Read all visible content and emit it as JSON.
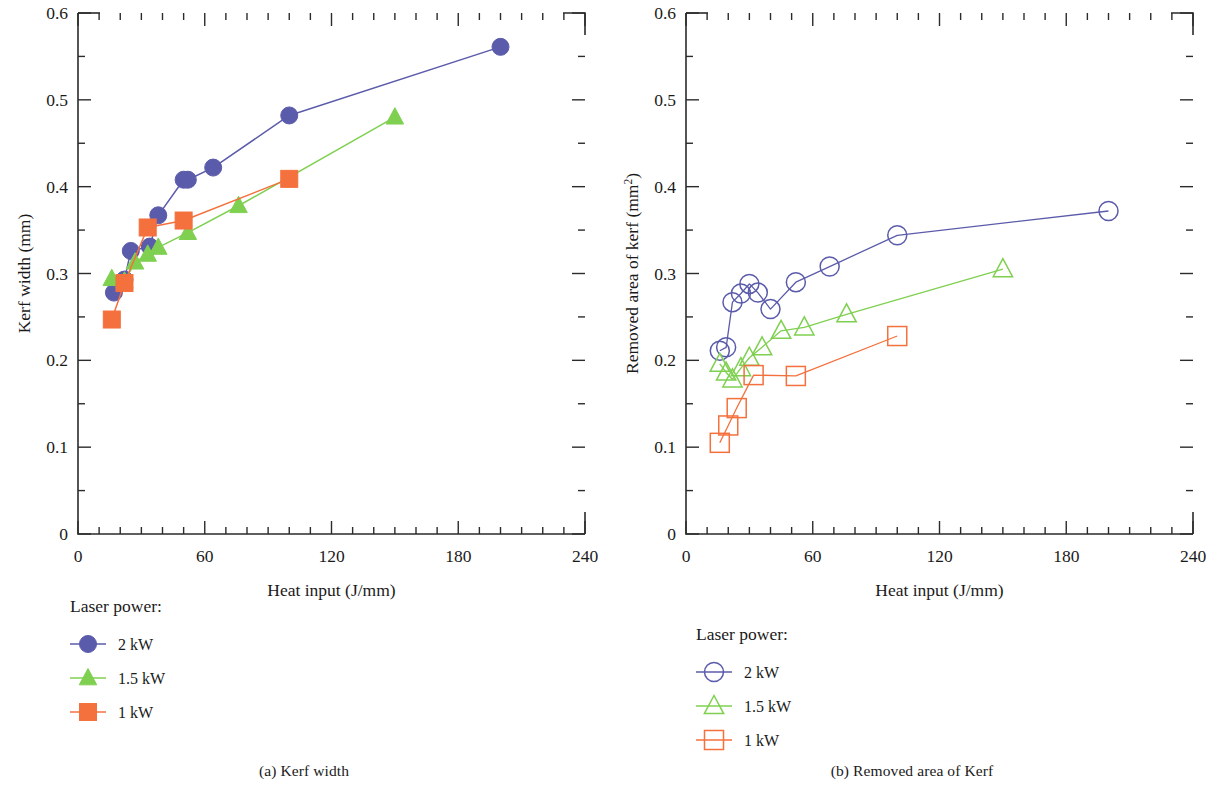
{
  "figure": {
    "panels": [
      {
        "id": "a",
        "caption_num": "(a)",
        "caption_text": "Kerf width"
      },
      {
        "id": "b",
        "caption_num": "(b)",
        "caption_text": "Removed area of Kerf"
      }
    ]
  },
  "legend": {
    "title": "Laser power:",
    "items": [
      {
        "label": "2 kW",
        "color": "#5b5bab",
        "marker": "circle"
      },
      {
        "label": "1.5 kW",
        "color": "#7fd050",
        "marker": "triangle"
      },
      {
        "label": "1 kW",
        "color": "#f4703c",
        "marker": "square"
      }
    ]
  },
  "colors": {
    "power_2kw": "#5b5bab",
    "power_1_5kw": "#7fd050",
    "power_1kw": "#f4703c",
    "axis": "#2b2b2b",
    "background": "#ffffff"
  },
  "chart_data": [
    {
      "type": "scatter",
      "panel": "a",
      "title": "Kerf width",
      "xlabel": "Heat input (J/mm)",
      "ylabel": "Kerf width (mm)",
      "xlim": [
        0,
        240
      ],
      "ylim": [
        0,
        0.6
      ],
      "xticks": [
        0,
        60,
        120,
        180,
        240
      ],
      "yticks": [
        "0",
        "0.1",
        "0.2",
        "0.3",
        "0.4",
        "0.5",
        "0.6"
      ],
      "xtick_minor_step": 10,
      "ytick_minor_step": 0.05,
      "grid": false,
      "marker_fill": "filled",
      "legend_position": "below-left",
      "series": [
        {
          "name": "2 kW",
          "color": "#5b5bab",
          "marker": "circle",
          "x": [
            17,
            22,
            25,
            34,
            38,
            50,
            52,
            64,
            100,
            200
          ],
          "y": [
            0.278,
            0.293,
            0.326,
            0.331,
            0.367,
            0.408,
            0.408,
            0.422,
            0.482,
            0.561
          ]
        },
        {
          "name": "1.5 kW",
          "color": "#7fd050",
          "marker": "triangle",
          "x": [
            16,
            22,
            27,
            33,
            38,
            52,
            76,
            150
          ],
          "y": [
            0.294,
            0.291,
            0.313,
            0.322,
            0.33,
            0.347,
            0.378,
            0.48
          ]
        },
        {
          "name": "1 kW",
          "color": "#f4703c",
          "marker": "square",
          "x": [
            16,
            22,
            33,
            50,
            100
          ],
          "y": [
            0.247,
            0.289,
            0.353,
            0.361,
            0.409
          ]
        }
      ]
    },
    {
      "type": "scatter",
      "panel": "b",
      "title": "Removed area of Kerf",
      "xlabel": "Heat input (J/mm)",
      "ylabel": "Removed area of kerf (mm2)",
      "ylabel_base": "Removed area of kerf (mm",
      "ylabel_sup": "2",
      "ylabel_tail": ")",
      "xlim": [
        0,
        240
      ],
      "ylim": [
        0,
        0.6
      ],
      "xticks": [
        0,
        60,
        120,
        180,
        240
      ],
      "yticks": [
        "0",
        "0.1",
        "0.2",
        "0.3",
        "0.4",
        "0.5",
        "0.6"
      ],
      "xtick_minor_step": 10,
      "ytick_minor_step": 0.05,
      "grid": false,
      "marker_fill": "hollow",
      "legend_position": "below-left",
      "series": [
        {
          "name": "2 kW",
          "color": "#5b5bab",
          "marker": "circle",
          "x": [
            16,
            19,
            22,
            26,
            30,
            34,
            40,
            52,
            68,
            100,
            200
          ],
          "y": [
            0.211,
            0.215,
            0.267,
            0.277,
            0.288,
            0.278,
            0.259,
            0.29,
            0.308,
            0.344,
            0.372
          ]
        },
        {
          "name": "1.5 kW",
          "color": "#7fd050",
          "marker": "triangle",
          "x": [
            16,
            19,
            22,
            26,
            30,
            36,
            45,
            56,
            76,
            150
          ],
          "y": [
            0.196,
            0.186,
            0.178,
            0.191,
            0.203,
            0.215,
            0.234,
            0.238,
            0.253,
            0.305
          ]
        },
        {
          "name": "1 kW",
          "color": "#f4703c",
          "marker": "square",
          "x": [
            16,
            20,
            24,
            32,
            52,
            100
          ],
          "y": [
            0.105,
            0.125,
            0.145,
            0.183,
            0.182,
            0.228
          ]
        }
      ]
    }
  ]
}
